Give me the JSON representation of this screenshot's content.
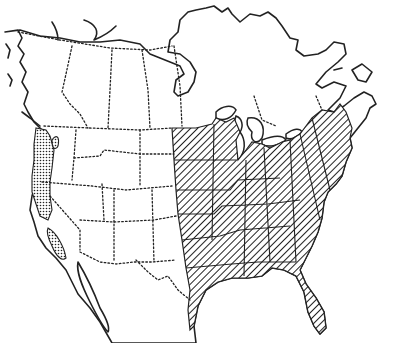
{
  "map": {
    "title": "",
    "subject": "North America range map",
    "colors": {
      "ink": "#222222",
      "background": "#ffffff"
    },
    "legend": [],
    "regions": [
      {
        "name": "eastern-range",
        "pattern": "diagonal-hatch",
        "description": "Eastern United States from the Great Plains eastward to the Atlantic coast, including Florida and the Gulf coast, extending into southern Ontario and the Maritimes"
      },
      {
        "name": "pacific-coast-range",
        "pattern": "stipple",
        "description": "Pacific coast from southern British Columbia through Washington, Oregon and California"
      }
    ]
  }
}
